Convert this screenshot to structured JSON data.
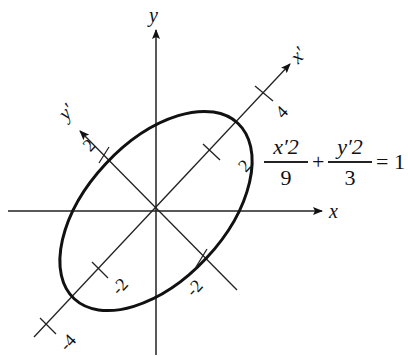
{
  "diagram": {
    "axes": {
      "x_label": "x",
      "y_label": "y",
      "x_prime_label": "x′",
      "y_prime_label": "y′"
    },
    "rotation_deg": 45,
    "tick_labels": {
      "x_prime_pos_2": "2",
      "x_prime_pos_4": "4",
      "x_prime_neg_2": "-2",
      "x_prime_neg_4": "-4",
      "y_prime_pos_2": "2",
      "y_prime_neg_2": "-2"
    },
    "ellipse": {
      "semi_major": 3,
      "semi_minor": 1.732,
      "stroke_color": "#111111"
    },
    "equation": {
      "term1_numerator": "x′2",
      "term1_denominator": "9",
      "plus": "+",
      "term2_numerator": "y′2",
      "term2_denominator": "3",
      "equals": "= 1"
    }
  }
}
